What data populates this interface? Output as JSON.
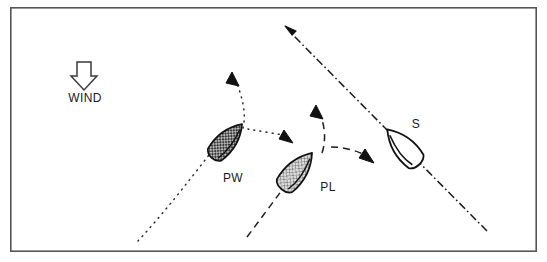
{
  "diagram": {
    "canvas": {
      "width": 547,
      "height": 262
    },
    "background_color": "#ffffff",
    "ink_color": "#1a1a1a",
    "frame": {
      "name": "diagram-frame",
      "x": 10,
      "y": 7,
      "width": 527,
      "height": 245,
      "stroke": "#555555",
      "stroke_width": 1.6
    },
    "wind": {
      "label": "WIND",
      "label_x": 85,
      "label_y": 102,
      "arrow_x": 84,
      "arrow_y": 62,
      "direction": "down",
      "arrow_fill": "#ffffff",
      "arrow_stroke": "#333333"
    },
    "boats": [
      {
        "id": "pw",
        "label": "PW",
        "label_x": 233,
        "label_y": 182,
        "hull_cx": 226,
        "hull_cy": 142,
        "heading_deg": 42,
        "fill_style": "cross-hatch-dark",
        "fill_color": "#8e8e8e",
        "stroke": "#1a1a1a"
      },
      {
        "id": "pl",
        "label": "PL",
        "label_x": 328,
        "label_y": 191,
        "hull_cx": 296,
        "hull_cy": 172,
        "heading_deg": 40,
        "fill_style": "cross-hatch-light",
        "fill_color": "#c8c8c8",
        "stroke": "#1a1a1a"
      },
      {
        "id": "s",
        "label": "S",
        "label_x": 416,
        "label_y": 128,
        "hull_cx": 404,
        "hull_cy": 148,
        "heading_deg": -42,
        "fill_style": "none",
        "fill_color": "#ffffff",
        "stroke": "#1a1a1a"
      }
    ],
    "tracks": [
      {
        "id": "pw-track-in",
        "name": "pw-incoming-dotted-track",
        "style": "dotted",
        "start": [
          138,
          241
        ],
        "end": [
          208,
          156
        ],
        "has_arrowhead": false
      },
      {
        "id": "pw-track-luff",
        "name": "pw-luff-dotted-track",
        "style": "dotted",
        "start": [
          240,
          126
        ],
        "end": [
          234,
          77
        ],
        "has_arrowhead": true,
        "arrow_at": [
          233,
          75
        ],
        "arrow_deg": -80
      },
      {
        "id": "pw-track-bear",
        "name": "pw-bearaway-dotted-track",
        "style": "dotted",
        "start": [
          250,
          129
        ],
        "end": [
          285,
          136
        ],
        "has_arrowhead": true,
        "arrow_at": [
          288,
          138
        ],
        "arrow_deg": 28
      },
      {
        "id": "pl-track-in",
        "name": "pl-incoming-dashed-track",
        "style": "dashed",
        "start": [
          247,
          236
        ],
        "end": [
          280,
          190
        ],
        "has_arrowhead": false
      },
      {
        "id": "pl-track-luff",
        "name": "pl-luff-dashed-track",
        "style": "dashed",
        "start": [
          320,
          152
        ],
        "end": [
          317,
          112
        ],
        "has_arrowhead": true,
        "arrow_at": [
          317,
          108
        ],
        "arrow_deg": -82
      },
      {
        "id": "pl-track-bear",
        "name": "pl-bearaway-dashed-track",
        "style": "dashed",
        "start": [
          330,
          148
        ],
        "end": [
          366,
          156
        ],
        "has_arrowhead": true,
        "arrow_at": [
          370,
          159
        ],
        "arrow_deg": 30
      },
      {
        "id": "s-track",
        "name": "s-dash-dot-track",
        "style": "dash-dot",
        "start": [
          487,
          231
        ],
        "end": [
          289,
          31
        ],
        "has_arrowhead": true,
        "arrow_at": [
          286,
          27
        ],
        "arrow_deg": -135
      }
    ],
    "legend_note": "PW = port windward, PL = port leeward, S = starboard"
  }
}
